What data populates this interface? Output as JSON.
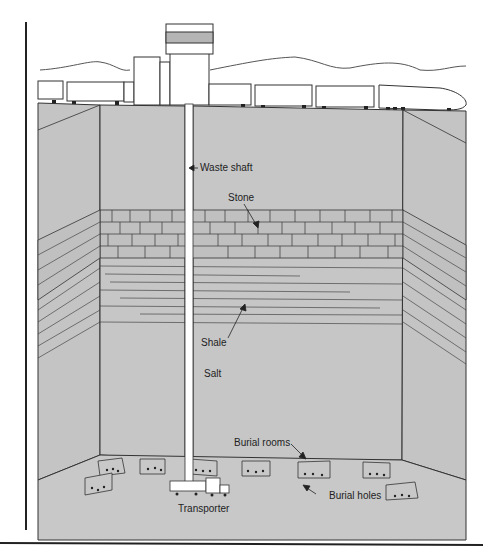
{
  "diagram": {
    "type": "cross-section",
    "colors": {
      "rock": "#c4c4c4",
      "line": "#2a2a2a",
      "background": "#ffffff",
      "band": "#b0b0b0"
    },
    "labels": {
      "waste_shaft": "Waste shaft",
      "stone": "Stone",
      "shale": "Shale",
      "salt": "Salt",
      "burial_rooms": "Burial rooms",
      "burial_holes": "Burial holes",
      "transporter": "Transporter"
    },
    "layers": [
      "Stone",
      "Shale",
      "Salt"
    ]
  }
}
